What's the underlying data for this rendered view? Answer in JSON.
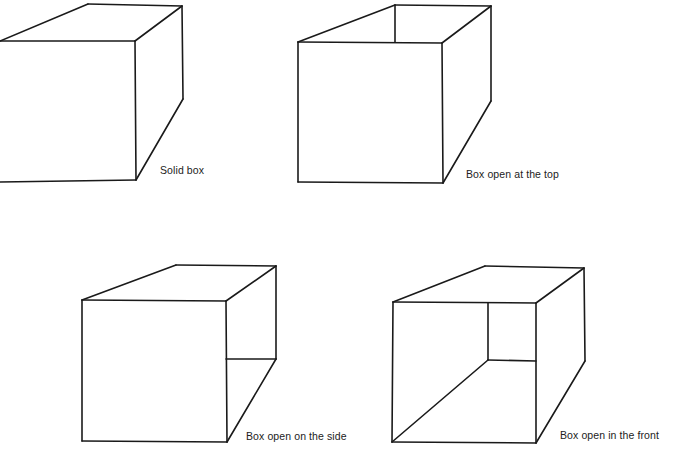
{
  "diagram": {
    "stroke_color": "#1a1a1a",
    "background": "#ffffff",
    "boxes": [
      {
        "id": "solid-box",
        "label": "Solid box",
        "label_pos": {
          "x": 160,
          "y": 164
        },
        "edges": [
          [
            [
              0,
              41
            ],
            [
              135,
              41
            ]
          ],
          [
            [
              135,
              41
            ],
            [
              136,
              180
            ]
          ],
          [
            [
              136,
              180
            ],
            [
              0,
              182
            ]
          ],
          [
            [
              0,
              41
            ],
            [
              88,
              4
            ]
          ],
          [
            [
              88,
              4
            ],
            [
              182,
              6
            ]
          ],
          [
            [
              135,
              41
            ],
            [
              182,
              6
            ]
          ],
          [
            [
              182,
              6
            ],
            [
              183,
              99
            ]
          ],
          [
            [
              136,
              180
            ],
            [
              183,
              99
            ]
          ]
        ]
      },
      {
        "id": "box-open-top",
        "label": "Box open at the top",
        "label_pos": {
          "x": 466,
          "y": 168
        },
        "edges": [
          [
            [
              298,
              42
            ],
            [
              442,
              43
            ]
          ],
          [
            [
              442,
              43
            ],
            [
              443,
              183
            ]
          ],
          [
            [
              443,
              183
            ],
            [
              298,
              182
            ]
          ],
          [
            [
              298,
              182
            ],
            [
              298,
              42
            ]
          ],
          [
            [
              298,
              42
            ],
            [
              395,
              5
            ]
          ],
          [
            [
              395,
              5
            ],
            [
              491,
              6
            ]
          ],
          [
            [
              442,
              43
            ],
            [
              491,
              6
            ]
          ],
          [
            [
              395,
              5
            ],
            [
              395,
              42
            ]
          ],
          [
            [
              491,
              6
            ],
            [
              491,
              101
            ]
          ],
          [
            [
              443,
              183
            ],
            [
              491,
              101
            ]
          ]
        ]
      },
      {
        "id": "box-open-side",
        "label": "Box open on the side",
        "label_pos": {
          "x": 246,
          "y": 430
        },
        "edges": [
          [
            [
              82,
              300
            ],
            [
              226,
              301
            ]
          ],
          [
            [
              226,
              301
            ],
            [
              227,
              442
            ]
          ],
          [
            [
              227,
              442
            ],
            [
              82,
              441
            ]
          ],
          [
            [
              82,
              441
            ],
            [
              82,
              300
            ]
          ],
          [
            [
              82,
              300
            ],
            [
              176,
              265
            ]
          ],
          [
            [
              176,
              265
            ],
            [
              276,
              266
            ]
          ],
          [
            [
              226,
              301
            ],
            [
              276,
              266
            ]
          ],
          [
            [
              276,
              266
            ],
            [
              276,
              359
            ]
          ],
          [
            [
              226,
              359
            ],
            [
              276,
              359
            ]
          ],
          [
            [
              227,
              442
            ],
            [
              276,
              359
            ]
          ]
        ]
      },
      {
        "id": "box-open-front",
        "label": "Box open in the front",
        "label_pos": {
          "x": 560,
          "y": 429
        },
        "edges": [
          [
            [
              393,
              302
            ],
            [
              536,
              303
            ]
          ],
          [
            [
              536,
              303
            ],
            [
              536,
              443
            ]
          ],
          [
            [
              536,
              443
            ],
            [
              392,
              442
            ]
          ],
          [
            [
              392,
              442
            ],
            [
              393,
              302
            ]
          ],
          [
            [
              393,
              302
            ],
            [
              485,
              266
            ]
          ],
          [
            [
              485,
              266
            ],
            [
              584,
              268
            ]
          ],
          [
            [
              536,
              303
            ],
            [
              584,
              268
            ]
          ],
          [
            [
              584,
              268
            ],
            [
              585,
              361
            ]
          ],
          [
            [
              536,
              443
            ],
            [
              585,
              361
            ]
          ],
          [
            [
              488,
              303
            ],
            [
              488,
              360
            ]
          ],
          [
            [
              488,
              360
            ],
            [
              536,
              361
            ]
          ],
          [
            [
              392,
              442
            ],
            [
              488,
              360
            ]
          ]
        ]
      }
    ]
  }
}
